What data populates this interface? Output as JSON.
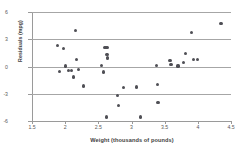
{
  "chart_data": {
    "type": "scatter",
    "title": "",
    "xlabel": "Weight (thousands of pounds)",
    "ylabel": "Residuals (mpg)",
    "xlim": [
      1.5,
      4.5
    ],
    "ylim": [
      -6,
      6
    ],
    "xticks": [
      "1.5",
      "2",
      "2.5",
      "3",
      "3.5",
      "4",
      "4.5"
    ],
    "xtick_values": [
      1.5,
      2,
      2.5,
      3,
      3.5,
      4,
      4.5
    ],
    "yticks": [
      "6",
      "3",
      "0",
      "-3",
      "-6"
    ],
    "ytick_values": [
      6,
      3,
      0,
      -3,
      -6
    ],
    "grid": "horizontal",
    "gridlines_y": [
      3,
      0,
      -3
    ],
    "legend": "none",
    "marker_color": "#4f4f55",
    "axis_color": "#9a9a9a",
    "points": [
      {
        "x": 1.88,
        "y": 2.35
      },
      {
        "x": 1.91,
        "y": -0.55
      },
      {
        "x": 1.98,
        "y": 1.95
      },
      {
        "x": 2.0,
        "y": 0.05
      },
      {
        "x": 2.05,
        "y": -0.45
      },
      {
        "x": 2.1,
        "y": -0.4
      },
      {
        "x": 2.12,
        "y": -1.15
      },
      {
        "x": 2.16,
        "y": 3.95
      },
      {
        "x": 2.17,
        "y": 0.8
      },
      {
        "x": 2.2,
        "y": -0.3
      },
      {
        "x": 2.28,
        "y": -2.15
      },
      {
        "x": 2.55,
        "y": 0.15
      },
      {
        "x": 2.58,
        "y": -0.6
      },
      {
        "x": 2.6,
        "y": 2.05
      },
      {
        "x": 2.63,
        "y": 2.1
      },
      {
        "x": 2.63,
        "y": 1.3
      },
      {
        "x": 2.64,
        "y": 1.0
      },
      {
        "x": 2.64,
        "y": 0.85
      },
      {
        "x": 2.62,
        "y": -5.55
      },
      {
        "x": 2.79,
        "y": -3.15
      },
      {
        "x": 2.81,
        "y": -4.3
      },
      {
        "x": 2.88,
        "y": -2.35
      },
      {
        "x": 3.08,
        "y": -2.25
      },
      {
        "x": 3.14,
        "y": -5.55
      },
      {
        "x": 3.38,
        "y": 0.15
      },
      {
        "x": 3.39,
        "y": -2.0
      },
      {
        "x": 3.4,
        "y": -3.95
      },
      {
        "x": 3.58,
        "y": 0.65
      },
      {
        "x": 3.59,
        "y": 0.25
      },
      {
        "x": 3.6,
        "y": 0.2
      },
      {
        "x": 3.7,
        "y": 0.05
      },
      {
        "x": 3.78,
        "y": 0.45
      },
      {
        "x": 3.82,
        "y": 1.45
      },
      {
        "x": 3.9,
        "y": 3.75
      },
      {
        "x": 3.94,
        "y": 0.75
      },
      {
        "x": 4.0,
        "y": 0.75
      },
      {
        "x": 4.35,
        "y": 4.7
      }
    ]
  }
}
